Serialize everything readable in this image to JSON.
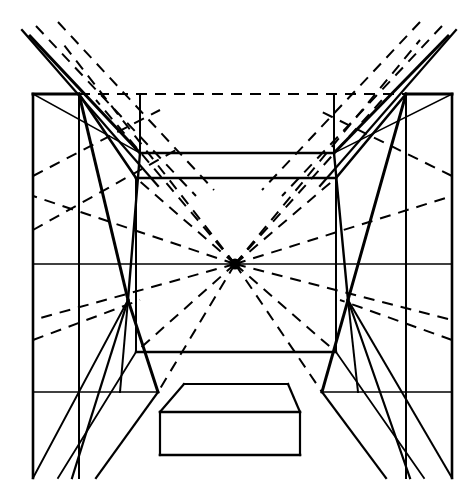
{
  "document": {
    "title": "One-Point Perspective Interior Construction",
    "type": "line-drawing",
    "canvas": {
      "width": 476,
      "height": 498,
      "background": "#ffffff"
    },
    "ink_color": "#000000"
  },
  "geometry": {
    "vanishing_point": {
      "x": 235,
      "y": 264,
      "label": "VP"
    },
    "horizon_line": {
      "y": 264,
      "x1": 33,
      "x2": 452,
      "style": "solid"
    },
    "outer_frame": {
      "left_x": 33,
      "right_x": 452,
      "top_y": 94,
      "bottom_y": 478,
      "top_edge_style": "dashed-between-corners"
    },
    "outer_corner_columns": {
      "left": {
        "x1": 33,
        "x2": 79,
        "top_y": 94,
        "bottom_y": 478
      },
      "right": {
        "x1": 406,
        "x2": 452,
        "top_y": 94,
        "bottom_y": 478
      }
    },
    "ceiling_plane": {
      "front_left": {
        "x": 33,
        "y": 94
      },
      "front_right": {
        "x": 452,
        "y": 94
      },
      "back_left": {
        "x": 140,
        "y": 153
      },
      "back_right": {
        "x": 334,
        "y": 153
      }
    },
    "inner_room": {
      "top_y": 178,
      "bottom_y": 352,
      "left_x": 136,
      "right_x": 336,
      "back_wall_top_y": 178,
      "back_wall_bottom_y": 352
    },
    "platform": {
      "top_face": {
        "x1": 172,
        "x2": 300,
        "x3": 288,
        "x4": 184,
        "y_back": 384,
        "y_front": 412
      },
      "front_face": {
        "x1": 160,
        "x2": 300,
        "y_top": 412,
        "y_bottom": 455
      }
    },
    "pier_left": {
      "top_x": 140,
      "waist_x": 128,
      "bottom_x": 158,
      "top_y": 94,
      "waist_y": 300,
      "bottom_y": 392
    },
    "pier_right": {
      "top_x": 334,
      "waist_x": 348,
      "bottom_x": 322,
      "top_y": 94,
      "waist_y": 300,
      "bottom_y": 392
    }
  },
  "chart_data": {
    "type": "line-drawing",
    "vanishing_point": [
      235,
      264
    ],
    "line_styles": {
      "solid_structure": {
        "color": "#000000",
        "widths": [
          1.4,
          2.2,
          3.2
        ]
      },
      "dashed_construction": {
        "color": "#000000",
        "width": 2.0,
        "dash": "11,8"
      }
    },
    "solid_lines": [
      {
        "name": "outer-top-left-segment",
        "points": [
          [
            33,
            94
          ],
          [
            79,
            94
          ]
        ],
        "w": 3.0
      },
      {
        "name": "outer-top-right-segment",
        "points": [
          [
            406,
            94
          ],
          [
            452,
            94
          ]
        ],
        "w": 3.0
      },
      {
        "name": "outer-left-vertical",
        "points": [
          [
            33,
            94
          ],
          [
            33,
            478
          ]
        ],
        "w": 2.6
      },
      {
        "name": "outer-right-vertical",
        "points": [
          [
            452,
            94
          ],
          [
            452,
            478
          ]
        ],
        "w": 2.6
      },
      {
        "name": "outer-left-inner-vertical",
        "points": [
          [
            79,
            94
          ],
          [
            79,
            478
          ]
        ],
        "w": 2.0
      },
      {
        "name": "outer-right-inner-vertical",
        "points": [
          [
            406,
            94
          ],
          [
            406,
            478
          ]
        ],
        "w": 2.0
      },
      {
        "name": "horizon-line",
        "points": [
          [
            33,
            264
          ],
          [
            452,
            264
          ]
        ],
        "w": 1.6
      },
      {
        "name": "ceiling-left-diagonal",
        "points": [
          [
            33,
            94
          ],
          [
            140,
            153
          ]
        ],
        "w": 1.6
      },
      {
        "name": "ceiling-right-diagonal",
        "points": [
          [
            452,
            94
          ],
          [
            334,
            153
          ]
        ],
        "w": 1.6
      },
      {
        "name": "ceiling-back-edge",
        "points": [
          [
            140,
            153
          ],
          [
            334,
            153
          ]
        ],
        "w": 2.4
      },
      {
        "name": "soffit-left-diagonal",
        "points": [
          [
            79,
            94
          ],
          [
            136,
            178
          ]
        ],
        "w": 2.6
      },
      {
        "name": "soffit-right-diagonal",
        "points": [
          [
            406,
            94
          ],
          [
            336,
            178
          ]
        ],
        "w": 2.6
      },
      {
        "name": "inner-ceiling-edge",
        "points": [
          [
            136,
            178
          ],
          [
            336,
            178
          ]
        ],
        "w": 2.6
      },
      {
        "name": "inner-left-vertical",
        "points": [
          [
            136,
            178
          ],
          [
            136,
            352
          ]
        ],
        "w": 2.0
      },
      {
        "name": "inner-right-vertical",
        "points": [
          [
            336,
            178
          ],
          [
            336,
            352
          ]
        ],
        "w": 2.0
      },
      {
        "name": "inner-floor-edge",
        "points": [
          [
            136,
            352
          ],
          [
            336,
            352
          ]
        ],
        "w": 2.4
      },
      {
        "name": "pier-left-outer",
        "points": [
          [
            79,
            94
          ],
          [
            128,
            300
          ]
        ],
        "w": 3.0
      },
      {
        "name": "pier-left-inner",
        "points": [
          [
            128,
            300
          ],
          [
            158,
            392
          ]
        ],
        "w": 3.0
      },
      {
        "name": "pier-left-back",
        "points": [
          [
            140,
            94
          ],
          [
            140,
            153
          ]
        ],
        "w": 2.0
      },
      {
        "name": "pier-left-face",
        "points": [
          [
            140,
            153
          ],
          [
            128,
            300
          ]
        ],
        "w": 2.4
      },
      {
        "name": "pier-left-face-lower",
        "points": [
          [
            128,
            300
          ],
          [
            120,
            392
          ]
        ],
        "w": 2.0
      },
      {
        "name": "pier-right-outer",
        "points": [
          [
            406,
            94
          ],
          [
            348,
            300
          ]
        ],
        "w": 3.0
      },
      {
        "name": "pier-right-inner",
        "points": [
          [
            348,
            300
          ],
          [
            322,
            392
          ]
        ],
        "w": 3.0
      },
      {
        "name": "pier-right-back",
        "points": [
          [
            334,
            94
          ],
          [
            334,
            153
          ]
        ],
        "w": 2.0
      },
      {
        "name": "pier-right-face",
        "points": [
          [
            334,
            153
          ],
          [
            348,
            300
          ]
        ],
        "w": 2.4
      },
      {
        "name": "pier-right-face-lower",
        "points": [
          [
            348,
            300
          ],
          [
            358,
            392
          ]
        ],
        "w": 2.0
      },
      {
        "name": "floor-left-ray-a",
        "points": [
          [
            128,
            300
          ],
          [
            33,
            478
          ]
        ],
        "w": 2.0
      },
      {
        "name": "floor-left-ray-b",
        "points": [
          [
            128,
            300
          ],
          [
            72,
            478
          ]
        ],
        "w": 2.2
      },
      {
        "name": "floor-left-ray-c",
        "points": [
          [
            158,
            392
          ],
          [
            96,
            478
          ]
        ],
        "w": 2.2
      },
      {
        "name": "floor-left-ray-d",
        "points": [
          [
            136,
            352
          ],
          [
            58,
            478
          ]
        ],
        "w": 1.8
      },
      {
        "name": "floor-right-ray-a",
        "points": [
          [
            348,
            300
          ],
          [
            452,
            478
          ]
        ],
        "w": 2.0
      },
      {
        "name": "floor-right-ray-b",
        "points": [
          [
            348,
            300
          ],
          [
            410,
            478
          ]
        ],
        "w": 2.2
      },
      {
        "name": "floor-right-ray-c",
        "points": [
          [
            322,
            392
          ],
          [
            386,
            478
          ]
        ],
        "w": 2.2
      },
      {
        "name": "floor-right-ray-d",
        "points": [
          [
            336,
            352
          ],
          [
            424,
            478
          ]
        ],
        "w": 1.8
      },
      {
        "name": "upper-left-long-diagonal",
        "points": [
          [
            30,
            36
          ],
          [
            140,
            153
          ]
        ],
        "w": 3.0
      },
      {
        "name": "upper-left-long-diagonal-2",
        "points": [
          [
            22,
            30
          ],
          [
            158,
            186
          ]
        ],
        "w": 2.2
      },
      {
        "name": "upper-right-long-diagonal",
        "points": [
          [
            448,
            36
          ],
          [
            334,
            153
          ]
        ],
        "w": 3.0
      },
      {
        "name": "upper-right-long-diagonal-2",
        "points": [
          [
            456,
            30
          ],
          [
            320,
            186
          ]
        ],
        "w": 2.2
      },
      {
        "name": "platform-top-back",
        "points": [
          [
            184,
            384
          ],
          [
            288,
            384
          ]
        ],
        "w": 2.2
      },
      {
        "name": "platform-top-left",
        "points": [
          [
            184,
            384
          ],
          [
            160,
            412
          ]
        ],
        "w": 2.2
      },
      {
        "name": "platform-top-right",
        "points": [
          [
            288,
            384
          ],
          [
            300,
            412
          ]
        ],
        "w": 2.2
      },
      {
        "name": "platform-top-front",
        "points": [
          [
            160,
            412
          ],
          [
            300,
            412
          ]
        ],
        "w": 2.4
      },
      {
        "name": "platform-left",
        "points": [
          [
            160,
            412
          ],
          [
            160,
            455
          ]
        ],
        "w": 2.2
      },
      {
        "name": "platform-right",
        "points": [
          [
            300,
            412
          ],
          [
            300,
            455
          ]
        ],
        "w": 2.2
      },
      {
        "name": "platform-bottom",
        "points": [
          [
            160,
            455
          ],
          [
            300,
            455
          ]
        ],
        "w": 2.6
      },
      {
        "name": "floor-band-left",
        "points": [
          [
            33,
            392
          ],
          [
            158,
            392
          ]
        ],
        "w": 1.6
      },
      {
        "name": "floor-band-right",
        "points": [
          [
            322,
            392
          ],
          [
            452,
            392
          ]
        ],
        "w": 1.6
      }
    ],
    "dashed_lines": [
      {
        "name": "top-dashed-horizontal",
        "points": [
          [
            79,
            94
          ],
          [
            406,
            94
          ]
        ]
      },
      {
        "name": "vp-ray-upper-left-1",
        "points": [
          [
            235,
            264
          ],
          [
            96,
            100
          ]
        ]
      },
      {
        "name": "vp-ray-upper-left-2",
        "points": [
          [
            235,
            264
          ],
          [
            60,
            40
          ]
        ]
      },
      {
        "name": "vp-ray-upper-left-3",
        "points": [
          [
            235,
            264
          ],
          [
            136,
            178
          ]
        ]
      },
      {
        "name": "vp-ray-upper-right-1",
        "points": [
          [
            235,
            264
          ],
          [
            382,
            100
          ]
        ]
      },
      {
        "name": "vp-ray-upper-right-2",
        "points": [
          [
            235,
            264
          ],
          [
            420,
            40
          ]
        ]
      },
      {
        "name": "vp-ray-upper-right-3",
        "points": [
          [
            235,
            264
          ],
          [
            336,
            178
          ]
        ]
      },
      {
        "name": "vp-ray-lower-left-1",
        "points": [
          [
            235,
            264
          ],
          [
            136,
            352
          ]
        ]
      },
      {
        "name": "vp-ray-lower-left-2",
        "points": [
          [
            235,
            264
          ],
          [
            158,
            392
          ]
        ]
      },
      {
        "name": "vp-ray-left-shallow",
        "points": [
          [
            235,
            264
          ],
          [
            33,
            320
          ]
        ]
      },
      {
        "name": "vp-ray-left-shallow-2",
        "points": [
          [
            235,
            264
          ],
          [
            33,
            196
          ]
        ]
      },
      {
        "name": "vp-ray-lower-right-1",
        "points": [
          [
            235,
            264
          ],
          [
            336,
            352
          ]
        ]
      },
      {
        "name": "vp-ray-lower-right-2",
        "points": [
          [
            235,
            264
          ],
          [
            322,
            392
          ]
        ]
      },
      {
        "name": "vp-ray-right-shallow",
        "points": [
          [
            235,
            264
          ],
          [
            452,
            320
          ]
        ]
      },
      {
        "name": "vp-ray-right-shallow-2",
        "points": [
          [
            235,
            264
          ],
          [
            452,
            196
          ]
        ]
      },
      {
        "name": "left-upper-aux-1",
        "points": [
          [
            33,
            176
          ],
          [
            160,
            110
          ]
        ]
      },
      {
        "name": "left-upper-aux-2",
        "points": [
          [
            33,
            230
          ],
          [
            176,
            150
          ]
        ]
      },
      {
        "name": "right-upper-aux-1",
        "points": [
          [
            452,
            176
          ],
          [
            318,
            110
          ]
        ]
      },
      {
        "name": "left-outer-diag-1",
        "points": [
          [
            36,
            26
          ],
          [
            196,
            196
          ]
        ]
      },
      {
        "name": "left-outer-diag-2",
        "points": [
          [
            58,
            22
          ],
          [
            214,
            190
          ]
        ]
      },
      {
        "name": "right-outer-diag-1",
        "points": [
          [
            442,
            26
          ],
          [
            282,
            196
          ]
        ]
      },
      {
        "name": "right-outer-diag-2",
        "points": [
          [
            420,
            22
          ],
          [
            262,
            190
          ]
        ]
      },
      {
        "name": "lower-left-aux",
        "points": [
          [
            33,
            340
          ],
          [
            140,
            300
          ]
        ]
      },
      {
        "name": "lower-right-aux",
        "points": [
          [
            452,
            340
          ],
          [
            340,
            300
          ]
        ]
      }
    ]
  }
}
